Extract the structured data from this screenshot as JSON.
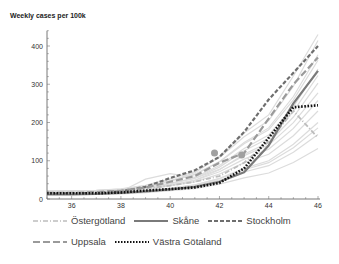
{
  "chart_data": {
    "type": "line",
    "title": "",
    "ylabel": "Weekly cases per 100k",
    "xlabel": "",
    "xlim": [
      35,
      46
    ],
    "ylim": [
      0,
      440
    ],
    "x_ticks": [
      36,
      38,
      40,
      42,
      44,
      46
    ],
    "y_ticks": [
      0,
      100,
      200,
      300,
      400
    ],
    "grid": false,
    "legend_position": "bottom",
    "x": [
      35,
      36,
      37,
      38,
      39,
      40,
      41,
      42,
      43,
      44,
      45,
      46
    ],
    "series": [
      {
        "name": "Östergötland",
        "style": "dash-dot",
        "color": "#bdbdbd",
        "values": [
          15,
          14,
          15,
          18,
          28,
          35,
          45,
          60,
          95,
          150,
          230,
          160
        ]
      },
      {
        "name": "Skåne",
        "style": "solid",
        "color": "#7a7a7a",
        "values": [
          12,
          12,
          13,
          16,
          20,
          25,
          32,
          45,
          70,
          140,
          250,
          335
        ]
      },
      {
        "name": "Stockholm",
        "style": "dashed",
        "color": "#6e6e6e",
        "values": [
          14,
          15,
          16,
          20,
          32,
          55,
          75,
          110,
          175,
          260,
          330,
          400
        ]
      },
      {
        "name": "Uppsala",
        "style": "long-dash",
        "color": "#9a9a9a",
        "values": [
          16,
          16,
          18,
          22,
          30,
          45,
          60,
          95,
          120,
          210,
          300,
          370
        ]
      },
      {
        "name": "Västra Götaland",
        "style": "dotted",
        "color": "#111111",
        "values": [
          15,
          15,
          15,
          17,
          22,
          26,
          30,
          42,
          80,
          160,
          240,
          245
        ]
      }
    ],
    "background_series_note": "many light gray unlabeled region lines"
  },
  "labels": {
    "ylabel": "Weekly cases per 100k",
    "legend": [
      "Östergötland",
      "Skåne",
      "Stockholm",
      "Uppsala",
      "Västra Götaland"
    ]
  }
}
